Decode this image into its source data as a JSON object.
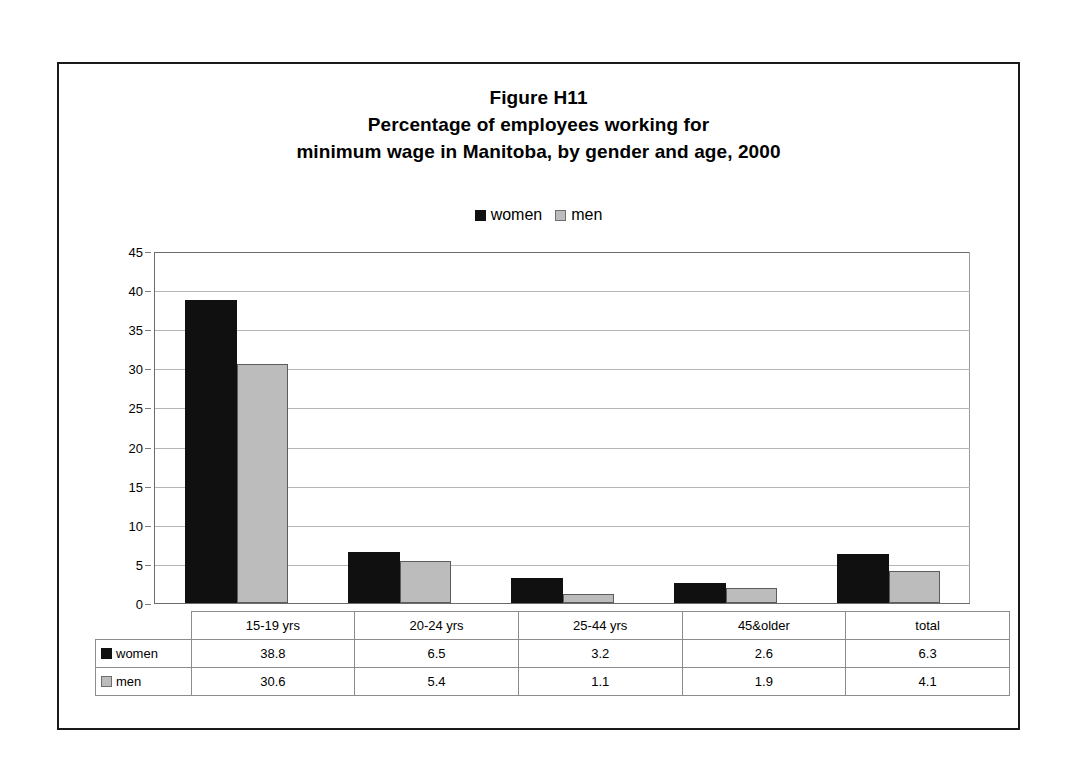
{
  "figure": {
    "title_lines": [
      "Figure H11",
      "Percentage of employees working for",
      "minimum wage in Manitoba, by gender and age, 2000"
    ]
  },
  "legend": {
    "entries": [
      {
        "label": "women",
        "color": "#101010"
      },
      {
        "label": "men",
        "color": "#bcbcbc"
      }
    ]
  },
  "table": {
    "corner_label": "",
    "row_labels": [
      "women",
      "men"
    ]
  },
  "chart_data": {
    "type": "bar",
    "xlabel": "",
    "ylabel": "",
    "ylim": [
      0,
      45
    ],
    "yticks": [
      0,
      5,
      10,
      15,
      20,
      25,
      30,
      35,
      40,
      45
    ],
    "ytick_labels": [
      "0",
      "5",
      "10",
      "15",
      "20",
      "25",
      "30",
      "35",
      "40",
      "45"
    ],
    "grid": true,
    "legend_position": "top-center",
    "categories": [
      "15-19 yrs",
      "20-24 yrs",
      "25-44 yrs",
      "45&older",
      "total"
    ],
    "series": [
      {
        "name": "women",
        "color": "#101010",
        "values": [
          38.8,
          6.5,
          3.2,
          2.6,
          6.3
        ]
      },
      {
        "name": "men",
        "color": "#bcbcbc",
        "values": [
          30.6,
          5.4,
          1.1,
          1.9,
          4.1
        ]
      }
    ]
  }
}
